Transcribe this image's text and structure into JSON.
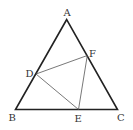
{
  "diagram": {
    "title": "",
    "colors": {
      "outline": "#222222",
      "inner": "#555555",
      "label": "#333333",
      "background": "#ffffff"
    },
    "points": {
      "A": {
        "x": 66.7,
        "y": 19.5
      },
      "B": {
        "x": 15.5,
        "y": 109.5
      },
      "C": {
        "x": 117.5,
        "y": 109.5
      },
      "D": {
        "x": 36,
        "y": 74
      },
      "E": {
        "x": 78.5,
        "y": 109.5
      },
      "F": {
        "x": 87.3,
        "y": 55.5
      }
    },
    "labels": {
      "A": "A",
      "B": "B",
      "C": "C",
      "D": "D",
      "E": "E",
      "F": "F"
    },
    "outer_triangle": [
      "A",
      "B",
      "C"
    ],
    "inner_triangle": [
      "D",
      "E",
      "F"
    ]
  }
}
